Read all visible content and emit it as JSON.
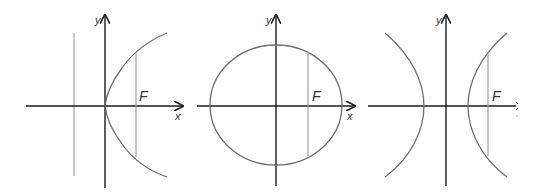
{
  "figure": {
    "panels": [
      {
        "name": "parabola",
        "labels": {
          "focus": "F",
          "x_axis": "x",
          "y_axis": "y"
        }
      },
      {
        "name": "ellipse",
        "labels": {
          "focus": "F",
          "x_axis": "x",
          "y_axis": "y"
        }
      },
      {
        "name": "hyperbola",
        "labels": {
          "focus": "F",
          "x_axis": "",
          "y_axis": "y"
        }
      }
    ],
    "colors": {
      "axis": "#1a1a1a",
      "curve": "#6e6e6e",
      "guide": "#9a9a9a",
      "label": "#333333"
    }
  }
}
